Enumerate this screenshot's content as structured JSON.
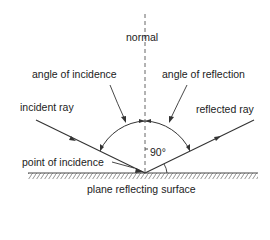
{
  "diagram": {
    "labels": {
      "normal": "normal",
      "angle_incidence": "angle of incidence",
      "angle_reflection": "angle of reflection",
      "incident_ray": "incident ray",
      "reflected_ray": "reflected ray",
      "point_incidence": "point of incidence",
      "right_angle": "90°",
      "surface": "plane reflecting surface"
    },
    "colors": {
      "line": "#333333",
      "hatch": "#777777"
    }
  }
}
